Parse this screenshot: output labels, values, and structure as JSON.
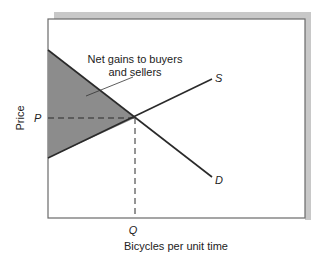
{
  "figure": {
    "annotation_line1": "Net gains to buyers",
    "annotation_line2": "and sellers",
    "ylabel": "Price",
    "xlabel": "Bicycles per unit time",
    "price_tick": "P",
    "quantity_tick": "Q",
    "supply_label": "S",
    "demand_label": "D",
    "colors": {
      "shaded_area": "#8c8c8c",
      "curves": "#2a2a2a",
      "frame_shadow": "#c8c8c8",
      "axis": "#555555"
    }
  }
}
